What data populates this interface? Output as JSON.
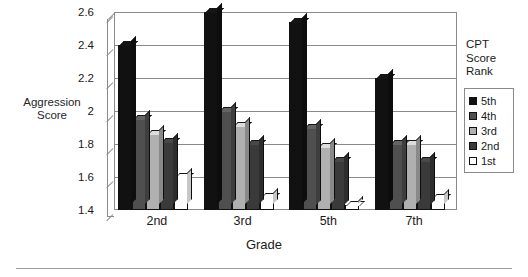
{
  "chart_data": {
    "type": "bar",
    "title": "",
    "xlabel": "Grade",
    "ylabel": "Aggression Score",
    "categories": [
      "2nd",
      "3rd",
      "5th",
      "7th"
    ],
    "ylim": [
      1.4,
      2.6
    ],
    "yticks": [
      "1.4",
      "1.6",
      "1.8",
      "2",
      "2.2",
      "2.4",
      "2.6"
    ],
    "ytick_values": [
      1.4,
      1.6,
      1.8,
      2.0,
      2.2,
      2.4,
      2.6
    ],
    "grid": true,
    "legend_position": "right",
    "legend_title": "CPT Score Rank",
    "series": [
      {
        "name": "5th",
        "color": "#111111",
        "values": [
          2.4,
          2.6,
          2.54,
          2.2
        ]
      },
      {
        "name": "4th",
        "color": "#4f4f4f",
        "values": [
          1.95,
          2.0,
          1.9,
          1.8
        ]
      },
      {
        "name": "3rd",
        "color": "#b0b0b0",
        "values": [
          1.86,
          1.91,
          1.78,
          1.8
        ]
      },
      {
        "name": "2nd",
        "color": "#3a3a3a",
        "values": [
          1.81,
          1.8,
          1.7,
          1.7
        ]
      },
      {
        "name": "1st",
        "color": "#ffffff",
        "values": [
          1.6,
          1.48,
          1.43,
          1.47
        ]
      }
    ]
  },
  "legend": {
    "title_lines": [
      "CPT",
      "Score",
      "Rank"
    ],
    "items": [
      {
        "label": "5th",
        "color": "#111111"
      },
      {
        "label": "4th",
        "color": "#4f4f4f"
      },
      {
        "label": "3rd",
        "color": "#b0b0b0"
      },
      {
        "label": "2nd",
        "color": "#3a3a3a"
      },
      {
        "label": "1st",
        "color": "#ffffff"
      }
    ]
  },
  "axes": {
    "y_title_lines": [
      "Aggression",
      "Score"
    ],
    "x_title": "Grade"
  }
}
